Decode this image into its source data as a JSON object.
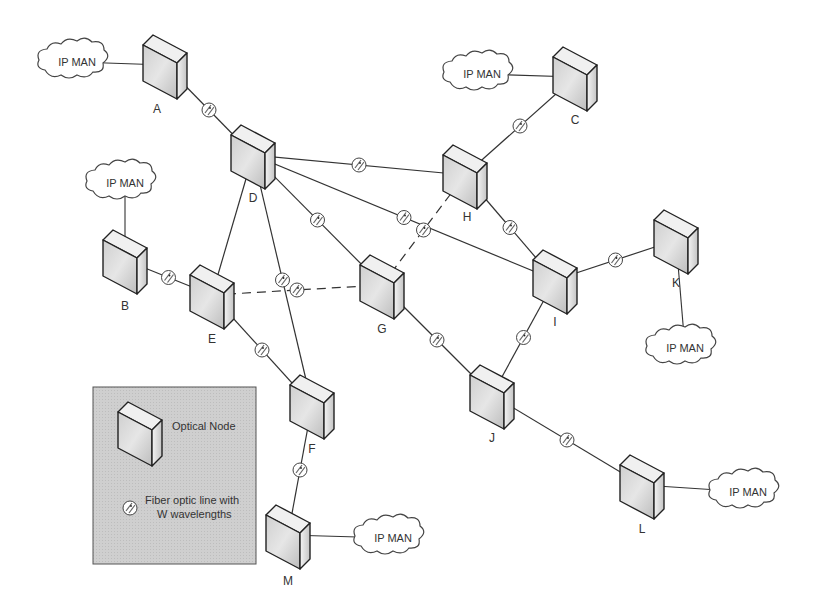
{
  "diagram": {
    "title": "",
    "nodes": [
      {
        "id": "A",
        "label": "A",
        "x": 165,
        "y": 65
      },
      {
        "id": "B",
        "label": "B",
        "x": 125,
        "y": 260
      },
      {
        "id": "C",
        "label": "C",
        "x": 575,
        "y": 77
      },
      {
        "id": "D",
        "label": "D",
        "x": 253,
        "y": 155
      },
      {
        "id": "E",
        "label": "E",
        "x": 212,
        "y": 295
      },
      {
        "id": "F",
        "label": "F",
        "x": 312,
        "y": 405
      },
      {
        "id": "G",
        "label": "G",
        "x": 382,
        "y": 285
      },
      {
        "id": "H",
        "label": "H",
        "x": 465,
        "y": 175
      },
      {
        "id": "I",
        "label": "I",
        "x": 555,
        "y": 280
      },
      {
        "id": "J",
        "label": "J",
        "x": 492,
        "y": 395
      },
      {
        "id": "K",
        "label": "K",
        "x": 676,
        "y": 240
      },
      {
        "id": "L",
        "label": "L",
        "x": 642,
        "y": 485
      },
      {
        "id": "M",
        "label": "M",
        "x": 288,
        "y": 535
      }
    ],
    "clouds": [
      {
        "id": "cloud-A",
        "label": "IP MAN",
        "x": 77,
        "y": 62,
        "attached_to": "A"
      },
      {
        "id": "cloud-B",
        "label": "IP MAN",
        "x": 125,
        "y": 183,
        "attached_to": "B"
      },
      {
        "id": "cloud-C",
        "label": "IP MAN",
        "x": 482,
        "y": 74,
        "attached_to": "C"
      },
      {
        "id": "cloud-K",
        "label": "IP MAN",
        "x": 685,
        "y": 348,
        "attached_to": "K"
      },
      {
        "id": "cloud-L",
        "label": "IP MAN",
        "x": 748,
        "y": 492,
        "attached_to": "L"
      },
      {
        "id": "cloud-M",
        "label": "IP MAN",
        "x": 393,
        "y": 538,
        "attached_to": "M"
      }
    ],
    "links": [
      {
        "from": "A",
        "to": "D",
        "style": "solid",
        "fiber": true
      },
      {
        "from": "C",
        "to": "H",
        "style": "solid",
        "fiber": true
      },
      {
        "from": "D",
        "to": "H",
        "style": "solid",
        "fiber": true
      },
      {
        "from": "D",
        "to": "I",
        "style": "solid",
        "fiber": true
      },
      {
        "from": "D",
        "to": "G",
        "style": "solid",
        "fiber": true
      },
      {
        "from": "D",
        "to": "F",
        "style": "solid",
        "fiber": true
      },
      {
        "from": "D",
        "to": "E",
        "style": "solid",
        "fiber": false
      },
      {
        "from": "B",
        "to": "E",
        "style": "solid",
        "fiber": true
      },
      {
        "from": "E",
        "to": "G",
        "style": "dashed",
        "fiber": true
      },
      {
        "from": "G",
        "to": "H",
        "style": "dashed",
        "fiber": true
      },
      {
        "from": "H",
        "to": "I",
        "style": "solid",
        "fiber": true
      },
      {
        "from": "E",
        "to": "F",
        "style": "solid",
        "fiber": true
      },
      {
        "from": "F",
        "to": "M",
        "style": "solid",
        "fiber": true
      },
      {
        "from": "G",
        "to": "J",
        "style": "solid",
        "fiber": true
      },
      {
        "from": "I",
        "to": "J",
        "style": "solid",
        "fiber": true
      },
      {
        "from": "I",
        "to": "K",
        "style": "solid",
        "fiber": true
      },
      {
        "from": "J",
        "to": "L",
        "style": "solid",
        "fiber": true
      }
    ],
    "legend": {
      "node_label": "Optical Node",
      "fiber_label_line1": "Fiber optic line with",
      "fiber_label_line2": "W wavelengths"
    },
    "colors": {
      "line": "#333333",
      "legend_bg": "#d0d0d0",
      "node_front": "#d8d8d8",
      "node_side": "#eeeeee"
    }
  }
}
